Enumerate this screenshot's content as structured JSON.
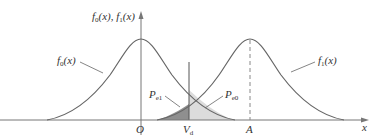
{
  "diagram": {
    "title": "",
    "y_axis_label": "f0(x), f1(x)",
    "x_axis_label": "x",
    "ticks": {
      "origin": "O",
      "threshold": "Vd",
      "mean1": "A"
    },
    "curves": [
      {
        "name": "f0(x)",
        "center": "O"
      },
      {
        "name": "f1(x)",
        "center": "A"
      }
    ],
    "regions": [
      {
        "name": "Pe1",
        "description": "area under f1 left of Vd",
        "fill": "#8c8c8c"
      },
      {
        "name": "Pe0",
        "description": "area under f0 right of Vd",
        "fill": "#d9d9d9"
      }
    ],
    "colors": {
      "curve": "#555555",
      "axis": "#666666",
      "dark_fill": "#8c8c8c",
      "light_fill": "#dcdcdc"
    }
  }
}
